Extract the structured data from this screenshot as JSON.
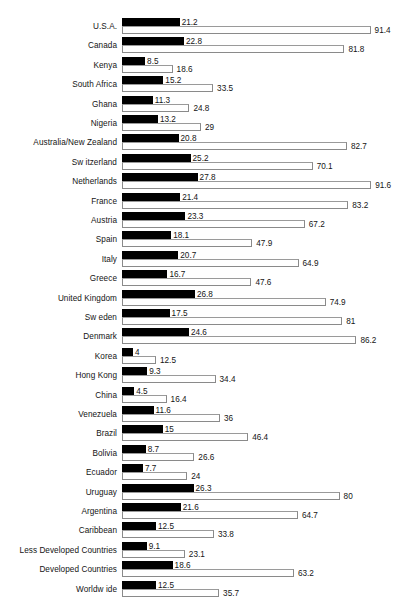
{
  "chart_data": {
    "type": "bar",
    "orientation": "horizontal",
    "title": "",
    "subtitle": "",
    "xlabel": "",
    "ylabel": "",
    "xlim": [
      0,
      91.6
    ],
    "grid": false,
    "legend": null,
    "legend_position": "none",
    "categories": [
      "U.S.A.",
      "Canada",
      "Kenya",
      "South Africa",
      "Ghana",
      "Nigeria",
      "Australia/New Zealand",
      "Sw itzerland",
      "Netherlands",
      "France",
      "Austria",
      "Spain",
      "Italy",
      "Greece",
      "United Kingdom",
      "Sw eden",
      "Denmark",
      "Korea",
      "Hong Kong",
      "China",
      "Venezuela",
      "Brazil",
      "Bolivia",
      "Ecuador",
      "Uruguay",
      "Argentina",
      "Caribbean",
      "Less Developed Countries",
      "Developed Countries",
      "Worldw ide"
    ],
    "series": [
      {
        "name": "primary",
        "style": "filled-black",
        "color": "#000000",
        "values": [
          21.2,
          22.8,
          8.5,
          15.2,
          11.3,
          13.2,
          20.8,
          25.2,
          27.8,
          21.4,
          23.3,
          18.1,
          20.7,
          16.7,
          26.8,
          17.5,
          24.6,
          4,
          9.3,
          4.5,
          11.6,
          15,
          8.7,
          7.7,
          26.3,
          21.6,
          12.5,
          9.1,
          18.6,
          12.5
        ],
        "labels": [
          "21.2",
          "22.8",
          "8.5",
          "15.2",
          "11.3",
          "13.2",
          "20.8",
          "25.2",
          "27.8",
          "21.4",
          "23.3",
          "18.1",
          "20.7",
          "16.7",
          "26.8",
          "17.5",
          "24.6",
          "4",
          "9.3",
          "4.5",
          "11.6",
          "15",
          "8.7",
          "7.7",
          "26.3",
          "21.6",
          "12.5",
          "9.1",
          "18.6",
          "12.5"
        ]
      },
      {
        "name": "secondary",
        "style": "outlined-white",
        "color": "#ffffff",
        "edgecolor": "#8a8a8a",
        "values": [
          91.4,
          81.8,
          18.6,
          33.5,
          24.8,
          29,
          82.7,
          70.1,
          91.6,
          83.2,
          67.2,
          47.9,
          64.9,
          47.6,
          74.9,
          81,
          86.2,
          12.5,
          34.4,
          16.4,
          36,
          46.4,
          26.6,
          24,
          80,
          64.7,
          33.8,
          23.1,
          63.2,
          35.7
        ],
        "labels": [
          "91.4",
          "81.8",
          "18.6",
          "33.5",
          "24.8",
          "29",
          "82.7",
          "70.1",
          "91.6",
          "83.2",
          "67.2",
          "47.9",
          "64.9",
          "47.6",
          "74.9",
          "81",
          "86.2",
          "12.5",
          "34.4",
          "16.4",
          "36",
          "46.4",
          "26.6",
          "24",
          "80",
          "64.7",
          "33.8",
          "23.1",
          "63.2",
          "35.7"
        ]
      }
    ]
  },
  "layout": {
    "plot_left_px": 122,
    "label_right_px": 117,
    "row_pitch_px": 19.4,
    "first_row_top_px": 18,
    "px_per_unit": 2.72,
    "bar_height_px": 8
  }
}
